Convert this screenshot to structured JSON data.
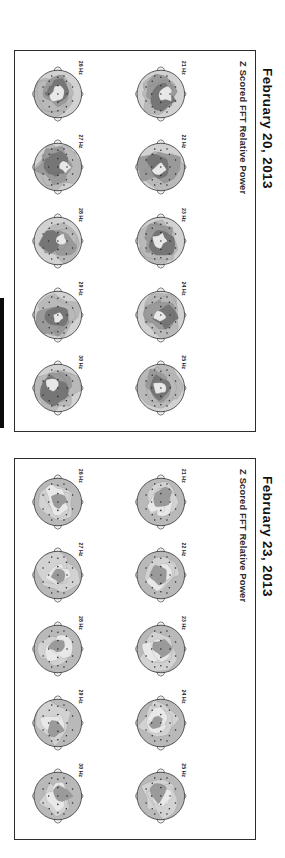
{
  "figure": {
    "title_a": "February 23, 2013",
    "title_b": "February 20, 2013",
    "subtitle": "Z Scored FFT Relative Power"
  },
  "panels": [
    {
      "id": "feb23",
      "date": "February 23, 2013",
      "subtitle": "Z Scored FFT Relative Power",
      "rows": [
        {
          "cells": [
            {
              "label": "21 Hz"
            },
            {
              "label": "22 Hz"
            },
            {
              "label": "23 Hz"
            },
            {
              "label": "24 Hz"
            },
            {
              "label": "25 Hz"
            }
          ]
        },
        {
          "cells": [
            {
              "label": "26 Hz"
            },
            {
              "label": "27 Hz"
            },
            {
              "label": "28 Hz"
            },
            {
              "label": "29 Hz"
            },
            {
              "label": "30 Hz"
            }
          ]
        }
      ]
    },
    {
      "id": "feb20",
      "date": "February 20, 2013",
      "subtitle": "Z Scored FFT Relative Power",
      "rows": [
        {
          "cells": [
            {
              "label": "21 Hz"
            },
            {
              "label": "22 Hz"
            },
            {
              "label": "23 Hz"
            },
            {
              "label": "24 Hz"
            },
            {
              "label": "25 Hz"
            }
          ]
        },
        {
          "cells": [
            {
              "label": "26 Hz"
            },
            {
              "label": "27 Hz"
            },
            {
              "label": "28 Hz"
            },
            {
              "label": "29 Hz"
            },
            {
              "label": "30 Hz"
            }
          ]
        }
      ]
    }
  ],
  "colors": {
    "background": "#ffffff",
    "border": "#2c2c2c",
    "text": "#121212",
    "head_outline": "#3a3a3a",
    "electrode": "#2b2b2b",
    "shade_lightest": "#e8e8e8",
    "shade_light": "#d2d2d2",
    "shade_mid": "#b9b9b9",
    "shade_dark": "#9a9a9a",
    "shade_darkest": "#767676",
    "edge_rule": "#0a0a0a"
  },
  "chart_data": {
    "type": "heatmap",
    "title": "Z Scored FFT Relative Power",
    "subtitle": "Scalp topographic maps, 21-30 Hz (beta band)",
    "xlabel": "",
    "ylabel": "",
    "legend": "",
    "grid": false,
    "map_layout": {
      "rows": 2,
      "cols": 5
    },
    "frequencies_hz": [
      21,
      22,
      23,
      24,
      25,
      26,
      27,
      28,
      29,
      30
    ],
    "electrode_count": 19,
    "electrode_montage": "10-20 system",
    "units": "z-score",
    "panels": [
      {
        "name": "February 23, 2013",
        "summary": "Predominantly mid-grey / low-amplitude maps; only mild focal light and dark pockets.",
        "peak_abs_z_by_frequency": [
          1.3,
          1.4,
          1.3,
          1.5,
          1.4,
          1.5,
          1.8,
          1.9,
          1.7,
          1.6
        ]
      },
      {
        "name": "February 20, 2013",
        "summary": "Extensive dark central / fronto-central and parieto-occipital elevations across all bins.",
        "peak_abs_z_by_frequency": [
          2.6,
          2.8,
          2.9,
          2.7,
          2.6,
          2.9,
          3.0,
          3.1,
          3.0,
          2.9
        ]
      }
    ]
  }
}
